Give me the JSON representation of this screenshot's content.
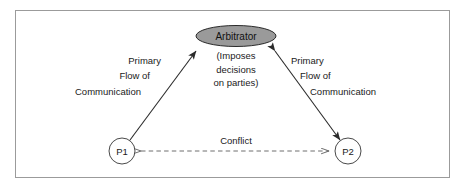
{
  "diagram": {
    "frame": {
      "border_color": "#9b9b9b",
      "background": "#ffffff"
    },
    "nodes": {
      "arbitrator": {
        "label": "Arbitrator",
        "fill_color": "#9a9a9a",
        "stroke_color": "#2b2b2b",
        "sub_lines": [
          "(Imposes",
          "decisions",
          "on parties)"
        ]
      },
      "party1": {
        "label": "P1",
        "fill_color": "#ffffff",
        "stroke_color": "#4a4a4a"
      },
      "party2": {
        "label": "P2",
        "fill_color": "#ffffff",
        "stroke_color": "#4a4a4a"
      }
    },
    "edges": {
      "left_flow": {
        "lines": [
          "Primary",
          "Flow of",
          "Communication"
        ],
        "style": "solid-double-arrow",
        "color": "#2b2b2b"
      },
      "right_flow": {
        "lines": [
          "Primary",
          "Flow of",
          "Communication"
        ],
        "style": "solid-double-arrow",
        "color": "#2b2b2b"
      },
      "conflict": {
        "label": "Conflict",
        "style": "dashed-double-open-arrow",
        "color": "#6e6e6e"
      }
    }
  }
}
